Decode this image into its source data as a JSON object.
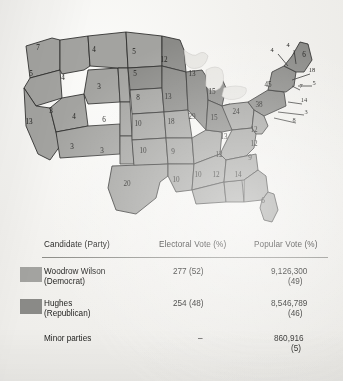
{
  "figure": {
    "wilson_color": "#a3a3a0",
    "hughes_color": "#8a8a87",
    "water_color": "#e7e6e2",
    "border_color": "#2b2b29"
  },
  "map": {
    "name": "electoral-vote-map",
    "states": [
      {
        "code": "WA",
        "label": "7",
        "x": 22,
        "y": 36,
        "party": "wilson"
      },
      {
        "code": "OR",
        "label": "5",
        "x": 15,
        "y": 62,
        "party": "wilson"
      },
      {
        "code": "CA",
        "label": "13",
        "x": 13,
        "y": 110,
        "party": "wilson"
      },
      {
        "code": "ID",
        "label": "4",
        "x": 47,
        "y": 66,
        "party": "wilson"
      },
      {
        "code": "NV",
        "label": "3",
        "x": 35,
        "y": 99,
        "party": "wilson"
      },
      {
        "code": "UT",
        "label": "4",
        "x": 58,
        "y": 105,
        "party": "wilson"
      },
      {
        "code": "AZ",
        "label": "3",
        "x": 56,
        "y": 135,
        "party": "wilson"
      },
      {
        "code": "MT",
        "label": "4",
        "x": 78,
        "y": 38,
        "party": "wilson"
      },
      {
        "code": "WY",
        "label": "3",
        "x": 83,
        "y": 75,
        "party": "wilson"
      },
      {
        "code": "CO",
        "label": "6",
        "x": 88,
        "y": 108,
        "party": "wilson"
      },
      {
        "code": "NM",
        "label": "3",
        "x": 86,
        "y": 139,
        "party": "wilson"
      },
      {
        "code": "ND",
        "label": "5",
        "x": 118,
        "y": 40,
        "party": "wilson"
      },
      {
        "code": "SD",
        "label": "5",
        "x": 119,
        "y": 62,
        "party": "hughes"
      },
      {
        "code": "NE",
        "label": "8",
        "x": 122,
        "y": 86,
        "party": "wilson"
      },
      {
        "code": "KS",
        "label": "10",
        "x": 122,
        "y": 112,
        "party": "wilson"
      },
      {
        "code": "OK",
        "label": "10",
        "x": 127,
        "y": 139,
        "party": "wilson"
      },
      {
        "code": "TX",
        "label": "20",
        "x": 111,
        "y": 172,
        "party": "wilson"
      },
      {
        "code": "MN",
        "label": "12",
        "x": 148,
        "y": 48,
        "party": "hughes"
      },
      {
        "code": "IA",
        "label": "13",
        "x": 152,
        "y": 85,
        "party": "hughes"
      },
      {
        "code": "MO",
        "label": "18",
        "x": 155,
        "y": 110,
        "party": "wilson"
      },
      {
        "code": "AR",
        "label": "9",
        "x": 157,
        "y": 140,
        "party": "wilson"
      },
      {
        "code": "LA",
        "label": "10",
        "x": 160,
        "y": 168,
        "party": "wilson"
      },
      {
        "code": "WI",
        "label": "13",
        "x": 176,
        "y": 62,
        "party": "hughes"
      },
      {
        "code": "IL",
        "label": "29",
        "x": 176,
        "y": 105,
        "party": "hughes"
      },
      {
        "code": "MI",
        "label": "15",
        "x": 196,
        "y": 80,
        "party": "hughes"
      },
      {
        "code": "IN",
        "label": "15",
        "x": 198,
        "y": 106,
        "party": "hughes"
      },
      {
        "code": "OH",
        "label": "24",
        "x": 220,
        "y": 100,
        "party": "wilson"
      },
      {
        "code": "KY",
        "label": "13",
        "x": 208,
        "y": 125,
        "party": "wilson"
      },
      {
        "code": "TN",
        "label": "12",
        "x": 203,
        "y": 143,
        "party": "wilson"
      },
      {
        "code": "MS",
        "label": "10",
        "x": 182,
        "y": 163,
        "party": "wilson"
      },
      {
        "code": "AL",
        "label": "12",
        "x": 200,
        "y": 163,
        "party": "wilson"
      },
      {
        "code": "GA",
        "label": "14",
        "x": 222,
        "y": 163,
        "party": "wilson"
      },
      {
        "code": "SC",
        "label": "9",
        "x": 234,
        "y": 146,
        "party": "wilson"
      },
      {
        "code": "NC",
        "label": "12",
        "x": 238,
        "y": 132,
        "party": "wilson"
      },
      {
        "code": "VA",
        "label": "12",
        "x": 238,
        "y": 118,
        "party": "wilson"
      },
      {
        "code": "FL",
        "label": "6",
        "x": 247,
        "y": 189,
        "party": "wilson"
      },
      {
        "code": "PA",
        "label": "38",
        "x": 243,
        "y": 93,
        "party": "hughes"
      },
      {
        "code": "NY",
        "label": "45",
        "x": 252,
        "y": 73,
        "party": "hughes"
      },
      {
        "code": "ME",
        "label": "6",
        "x": 288,
        "y": 43,
        "party": "hughes"
      }
    ],
    "callouts": [
      {
        "code": "VT",
        "label": "4",
        "x": 256,
        "y": 38
      },
      {
        "code": "NH",
        "label": "4",
        "x": 272,
        "y": 33
      },
      {
        "code": "MA",
        "label": "18",
        "x": 296,
        "y": 58
      },
      {
        "code": "RI",
        "label": "5",
        "x": 298,
        "y": 71
      },
      {
        "code": "CT",
        "label": "7",
        "x": 285,
        "y": 74
      },
      {
        "code": "NJ",
        "label": "14",
        "x": 288,
        "y": 88
      },
      {
        "code": "DE",
        "label": "3",
        "x": 290,
        "y": 100
      },
      {
        "code": "MD",
        "label": "8",
        "x": 278,
        "y": 108
      }
    ]
  },
  "table": {
    "name": "election-results-table",
    "headers": {
      "candidate": "Candidate (Party)",
      "electoral": "Electoral Vote (%)",
      "popular": "Popular Vote (%)"
    },
    "rows": [
      {
        "name": "Woodrow Wilson",
        "party": "(Democrat)",
        "electoral": "277 (52)",
        "popular": "9,126,300",
        "popular_pct": "(49)",
        "swatch": "#a3a3a0"
      },
      {
        "name": "Hughes",
        "party": "(Republican)",
        "electoral": "254 (48)",
        "popular": "8,546,789",
        "popular_pct": "(46)",
        "swatch": "#8a8a87"
      },
      {
        "name": "Minor parties",
        "party": "",
        "electoral": "–",
        "popular": "860,916",
        "popular_pct": "(5)",
        "swatch": ""
      }
    ]
  }
}
